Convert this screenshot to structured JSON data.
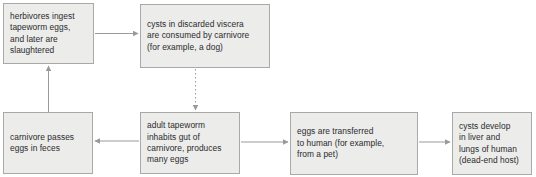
{
  "diagram": {
    "type": "flowchart",
    "colors": {
      "box_fill": "#ececeb",
      "box_border": "#a9a9a7",
      "text": "#2b2b2b",
      "arrow": "#9a9a98",
      "background": "#ffffff"
    },
    "nodes": [
      {
        "id": "herbivores",
        "label": "herbivores ingest\ntapeworm eggs,\nand later are\nslaughtered"
      },
      {
        "id": "cysts_viscera",
        "label": "cysts in discarded viscera\nare consumed by carnivore\n(for example, a dog)"
      },
      {
        "id": "carnivore_feces",
        "label": "carnivore passes\neggs in feces"
      },
      {
        "id": "adult_tapeworm",
        "label": "adult tapeworm\ninhabits gut of\ncarnivore, produces\nmany eggs"
      },
      {
        "id": "eggs_human",
        "label": "eggs are transferred\nto human (for example,\nfrom a pet)"
      },
      {
        "id": "cysts_develop",
        "label": "cysts develop\nin liver and\nlungs of human\n(dead-end host)"
      }
    ],
    "edges": [
      {
        "id": "herbivores-to-cysts-viscera",
        "from": "herbivores",
        "to": "cysts_viscera",
        "style": "solid",
        "direction": "right"
      },
      {
        "id": "cysts-viscera-to-adult-tapeworm",
        "from": "cysts_viscera",
        "to": "adult_tapeworm",
        "style": "dotted",
        "direction": "down"
      },
      {
        "id": "adult-tapeworm-to-carnivore-feces",
        "from": "adult_tapeworm",
        "to": "carnivore_feces",
        "style": "solid",
        "direction": "left"
      },
      {
        "id": "carnivore-feces-to-herbivores",
        "from": "carnivore_feces",
        "to": "herbivores",
        "style": "solid",
        "direction": "up"
      },
      {
        "id": "adult-tapeworm-to-eggs-human",
        "from": "adult_tapeworm",
        "to": "eggs_human",
        "style": "solid",
        "direction": "right"
      },
      {
        "id": "eggs-human-to-cysts-develop",
        "from": "eggs_human",
        "to": "cysts_develop",
        "style": "solid",
        "direction": "right"
      }
    ]
  }
}
